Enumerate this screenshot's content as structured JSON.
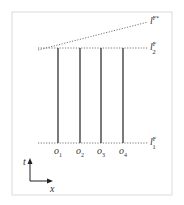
{
  "diagram": {
    "lines": {
      "top_slanted": {
        "label": "l",
        "sup": "F*"
      },
      "top_horizontal": {
        "label": "l",
        "sup": "F",
        "sub": "2"
      },
      "bottom_horizontal": {
        "label": "l",
        "sup": "F",
        "sub": "1"
      }
    },
    "observers": [
      {
        "label": "o",
        "sub": "1"
      },
      {
        "label": "o",
        "sub": "2"
      },
      {
        "label": "o",
        "sub": "3"
      },
      {
        "label": "o",
        "sub": "4"
      }
    ],
    "axes": {
      "vertical": "t",
      "horizontal": "x"
    },
    "colors": {
      "line": "#222222",
      "dotted": "#666666",
      "frame": "#dddddd"
    }
  }
}
